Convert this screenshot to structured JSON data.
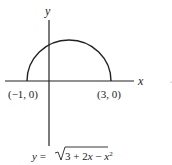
{
  "diagram": {
    "axes": {
      "x_label": "x",
      "y_label": "y"
    },
    "points": [
      {
        "label": "(−1, 0)",
        "x": -1,
        "y": 0
      },
      {
        "label": "(3, 0)",
        "x": 3,
        "y": 0
      }
    ],
    "curve": {
      "type": "semicircle",
      "center": [
        1,
        0
      ],
      "radius": 2,
      "upper_half": true
    },
    "equation": {
      "lhs": "y = ",
      "radicand": "3 + 2x − x",
      "exponent": "2"
    }
  }
}
